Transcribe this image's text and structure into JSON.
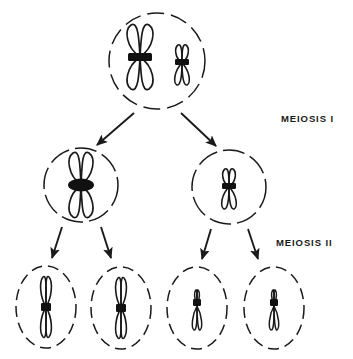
{
  "figure": {
    "type": "biological-process-diagram",
    "background_color": "#ffffff",
    "line_color": "#1a1a1a",
    "centromere_color": "#111111"
  },
  "labels": [
    {
      "id": "meiosis-1",
      "text": "MEIOSIS  I",
      "x": 281,
      "y": 113
    },
    {
      "id": "meiosis-2",
      "text": "MEIOSIS  II",
      "x": 276,
      "y": 237
    }
  ],
  "cells": [
    {
      "id": "parent-cell",
      "row": 0,
      "shape": "circle-dashed",
      "cx": 157,
      "cy": 61,
      "rx": 48,
      "ry": 48,
      "chromosomes": [
        {
          "id": "large-metacentric-bivalent",
          "kind": "large",
          "lobes": 4,
          "cx": 140,
          "cy": 57,
          "height": 66,
          "width": 27,
          "centromere": "bar"
        },
        {
          "id": "small-submetacentric-bivalent",
          "kind": "small",
          "lobes": 4,
          "cx": 182,
          "cy": 63,
          "height": 38,
          "width": 15,
          "centromere": "bar"
        }
      ]
    },
    {
      "id": "daughter-cell-left",
      "row": 1,
      "shape": "circle-dashed",
      "cx": 81,
      "cy": 185,
      "rx": 37,
      "ry": 37,
      "chromosomes": [
        {
          "id": "large-metacentric-dyad",
          "kind": "large",
          "lobes": 4,
          "cx": 81,
          "cy": 185,
          "height": 68,
          "width": 27,
          "centromere": "oval"
        }
      ]
    },
    {
      "id": "daughter-cell-right",
      "row": 1,
      "shape": "circle-dashed",
      "cx": 229,
      "cy": 187,
      "rx": 37,
      "ry": 37,
      "chromosomes": [
        {
          "id": "small-submetacentric-dyad",
          "kind": "small",
          "lobes": 4,
          "cx": 229,
          "cy": 187,
          "height": 38,
          "width": 15,
          "centromere": "bar"
        }
      ]
    },
    {
      "id": "gamete-cell-1",
      "row": 2,
      "shape": "ellipse-dashed",
      "cx": 46,
      "cy": 307,
      "rx": 30,
      "ry": 41,
      "chromosomes": [
        {
          "id": "large-metacentric-monad-1",
          "kind": "large",
          "lobes": 2,
          "cx": 46,
          "cy": 307,
          "height": 66,
          "width": 11,
          "centromere": "bar"
        }
      ]
    },
    {
      "id": "gamete-cell-2",
      "row": 2,
      "shape": "ellipse-dashed",
      "cx": 121,
      "cy": 308,
      "rx": 30,
      "ry": 41,
      "chromosomes": [
        {
          "id": "large-metacentric-monad-2",
          "kind": "large",
          "lobes": 2,
          "cx": 121,
          "cy": 308,
          "height": 66,
          "width": 11,
          "centromere": "bar"
        }
      ]
    },
    {
      "id": "gamete-cell-3",
      "row": 2,
      "shape": "ellipse-dashed",
      "cx": 197,
      "cy": 308,
      "rx": 30,
      "ry": 41,
      "chromosomes": [
        {
          "id": "small-submetacentric-monad-1",
          "kind": "small",
          "lobes": 2,
          "cx": 197,
          "cy": 308,
          "height": 38,
          "width": 8,
          "centromere": "bar"
        }
      ]
    },
    {
      "id": "gamete-cell-4",
      "row": 2,
      "shape": "ellipse-dashed",
      "cx": 274,
      "cy": 308,
      "rx": 30,
      "ry": 41,
      "chromosomes": [
        {
          "id": "small-submetacentric-monad-2",
          "kind": "small",
          "lobes": 2,
          "cx": 274,
          "cy": 308,
          "height": 38,
          "width": 8,
          "centromere": "bar"
        }
      ]
    }
  ],
  "arrows": [
    {
      "id": "arrow-parent-to-left",
      "x1": 134,
      "y1": 113,
      "x2": 97,
      "y2": 145
    },
    {
      "id": "arrow-parent-to-right",
      "x1": 181,
      "y1": 113,
      "x2": 216,
      "y2": 146
    },
    {
      "id": "arrow-left-to-g1",
      "x1": 62,
      "y1": 227,
      "x2": 52,
      "y2": 258
    },
    {
      "id": "arrow-left-to-g2",
      "x1": 101,
      "y1": 227,
      "x2": 111,
      "y2": 258
    },
    {
      "id": "arrow-right-to-g3",
      "x1": 211,
      "y1": 229,
      "x2": 202,
      "y2": 259
    },
    {
      "id": "arrow-right-to-g4",
      "x1": 248,
      "y1": 229,
      "x2": 258,
      "y2": 259
    }
  ]
}
